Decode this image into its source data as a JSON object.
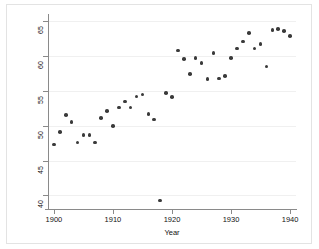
{
  "chart_data": {
    "type": "scatter",
    "title": "",
    "xlabel": "Year",
    "ylabel": "life expectancy",
    "xlim": [
      1899,
      1941
    ],
    "ylim": [
      38.2,
      65.6
    ],
    "xticks": [
      1900,
      1910,
      1920,
      1930,
      1940
    ],
    "yticks": [
      40,
      45,
      50,
      55,
      60,
      65
    ],
    "grid": true,
    "grid_axis": "y",
    "legend": "none",
    "marker_color": "#3a3a3a",
    "x": [
      1900,
      1901,
      1902,
      1903,
      1904,
      1905,
      1906,
      1907,
      1908,
      1909,
      1910,
      1911,
      1912,
      1913,
      1914,
      1915,
      1916,
      1917,
      1918,
      1919,
      1920,
      1921,
      1922,
      1923,
      1924,
      1925,
      1926,
      1927,
      1928,
      1929,
      1930,
      1931,
      1932,
      1933,
      1934,
      1935,
      1936,
      1937,
      1938,
      1939,
      1940
    ],
    "y": [
      47.3,
      49.1,
      51.5,
      50.5,
      47.6,
      48.7,
      48.7,
      47.6,
      51.1,
      52.1,
      50.0,
      52.6,
      53.5,
      52.6,
      54.2,
      54.5,
      51.7,
      50.9,
      39.3,
      54.7,
      54.1,
      60.8,
      59.6,
      57.4,
      59.7,
      59.0,
      56.7,
      60.4,
      56.8,
      57.1,
      59.7,
      61.1,
      62.1,
      63.3,
      61.1,
      61.7,
      58.5,
      63.7,
      63.9,
      63.6,
      62.9
    ],
    "annotations": [
      {
        "x": 1918,
        "y": 39.3,
        "note": "1918 influenza pandemic outlier"
      }
    ]
  }
}
